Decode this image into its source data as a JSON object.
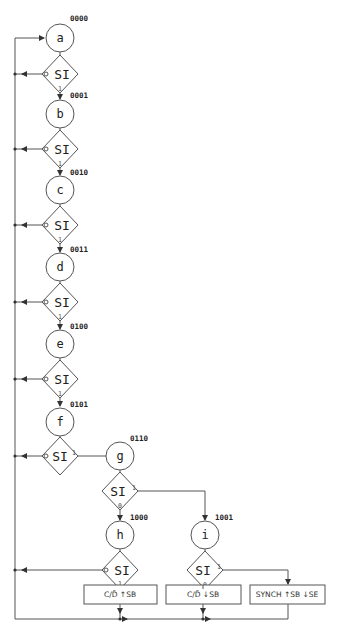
{
  "diagram": {
    "type": "state-machine-flowchart",
    "states": [
      {
        "id": "a",
        "label": "a",
        "code": "0000"
      },
      {
        "id": "b",
        "label": "b",
        "code": "0001"
      },
      {
        "id": "c",
        "label": "c",
        "code": "0010"
      },
      {
        "id": "d",
        "label": "d",
        "code": "0011"
      },
      {
        "id": "e",
        "label": "e",
        "code": "0100"
      },
      {
        "id": "f",
        "label": "f",
        "code": "0101"
      },
      {
        "id": "g",
        "label": "g",
        "code": "0110"
      },
      {
        "id": "h",
        "label": "h",
        "code": "1000"
      },
      {
        "id": "i",
        "label": "i",
        "code": "1001"
      }
    ],
    "decisions": [
      {
        "after": "a",
        "label": "SI",
        "port0": "0",
        "port1": "1"
      },
      {
        "after": "b",
        "label": "SI",
        "port0": "0",
        "port1": "1"
      },
      {
        "after": "c",
        "label": "SI",
        "port0": "0",
        "port1": "1"
      },
      {
        "after": "d",
        "label": "SI",
        "port0": "0",
        "port1": "1"
      },
      {
        "after": "e",
        "label": "SI",
        "port0": "0",
        "port1": "1"
      },
      {
        "after": "f",
        "label": "SI",
        "port0": "0",
        "port1": "1"
      },
      {
        "after": "g",
        "label": "SI",
        "port0": "0",
        "port1": "1"
      },
      {
        "after": "h",
        "label": "SI",
        "port0": "0",
        "port1": "1"
      },
      {
        "after": "i",
        "label": "SI",
        "port0": "0",
        "port1": "1"
      }
    ],
    "outputs": [
      {
        "id": "box1",
        "label": "C/D̄ ↑SB"
      },
      {
        "id": "box2",
        "label": "C/D̄ ↓SB"
      },
      {
        "id": "box3",
        "label": "SYNCH ↑SB ↓SE"
      }
    ],
    "colors": {
      "line": "#555555",
      "text": "#222222",
      "background": "#ffffff"
    }
  }
}
